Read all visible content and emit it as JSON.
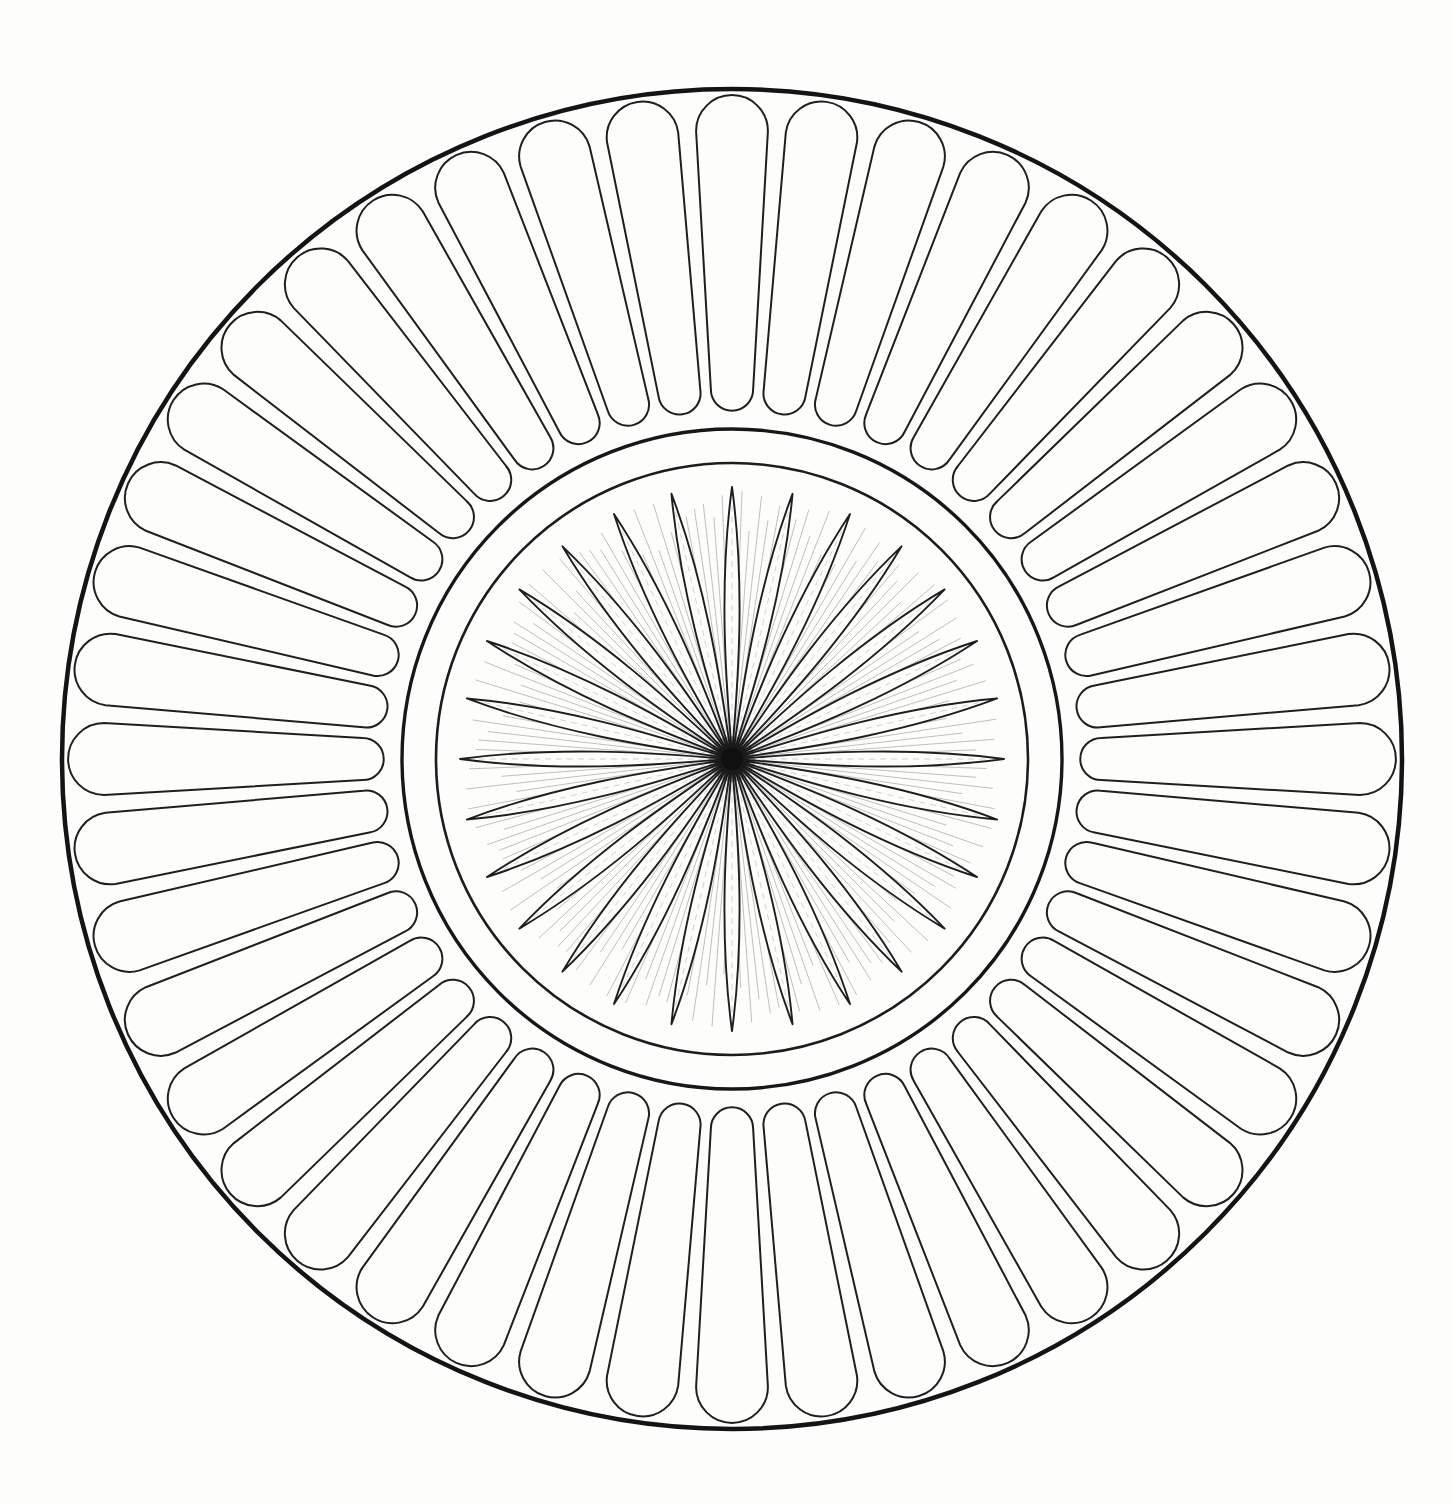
{
  "artwork": {
    "title": "Radial Rosette Mandala Line Drawing",
    "kind": "line-art-coloring-page",
    "canvas": {
      "width": 1452,
      "height": 1505
    },
    "background_color": "#fdfdfb",
    "ink_color": "#1a1a1a",
    "faint_ink_color": "#8a8a8a",
    "center": {
      "x": 732,
      "y": 759
    }
  },
  "rings": [
    {
      "name": "outer-boundary-circle",
      "role": "outermost heavy circular border",
      "radius": 670,
      "stroke_width": 4.5,
      "color": "#141414"
    },
    {
      "name": "outer-spoke-ring",
      "role": "ring of rounded capsule spokes",
      "count": 44,
      "inner_radius": 353,
      "outer_radius": 655,
      "cap_radius_inner": 17,
      "cap_radius_outer": 26,
      "stroke_width": 2.0,
      "color": "#1f1f1f"
    },
    {
      "name": "mid-circle-outer",
      "role": "outer line of the plain middle band",
      "radius": 330,
      "stroke_width": 3.4,
      "color": "#171717"
    },
    {
      "name": "mid-circle-inner",
      "role": "inner line of the plain middle band",
      "radius": 296,
      "stroke_width": 2.6,
      "color": "#1c1c1c"
    },
    {
      "name": "petal-rosette",
      "role": "central flower of pointed lens petals",
      "count": 28,
      "tip_radius": 272,
      "petal_half_width_deg": 6.2,
      "belly_radius_fraction": 0.56,
      "stroke_width": 1.9,
      "color": "#1e1e1e"
    },
    {
      "name": "petal-midribs",
      "role": "faint centre vein inside each petal",
      "count": 28,
      "stroke_width": 0.8,
      "color": "#9a9a9a"
    },
    {
      "name": "center-burst",
      "role": "dense hairline rays converging on the hub",
      "count": 168,
      "inner_radius": 0,
      "outer_radius": 268,
      "stroke_width": 0.7,
      "color": "#2a2a2a"
    },
    {
      "name": "center-hub",
      "role": "solid dark knot where every ray meets",
      "radius": 11,
      "color": "#101010"
    }
  ],
  "chart_data": {
    "type": "pie",
    "xlabel": "",
    "ylabel": "",
    "categories": [
      "outer-spoke-ring",
      "petal-rosette",
      "center-burst"
    ],
    "values": [
      44,
      28,
      168
    ],
    "series": [
      {
        "name": "element count per ring",
        "values": [
          44,
          28,
          168
        ]
      },
      {
        "name": "outer radius (px)",
        "values": [
          655,
          272,
          268
        ]
      },
      {
        "name": "inner radius (px)",
        "values": [
          353,
          0,
          0
        ]
      }
    ],
    "annotations": [
      "outer boundary circle radius 670",
      "middle band between radius 296 and radius 330",
      "all geometry concentric about (732, 759)"
    ],
    "legend_position": "none",
    "grid": false
  }
}
